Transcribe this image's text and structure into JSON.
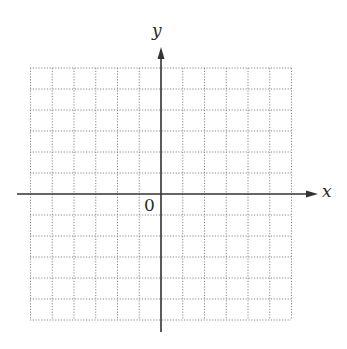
{
  "chart_data": {
    "type": "coordinate-grid",
    "title": "",
    "xlabel": "x",
    "ylabel": "y",
    "origin_label": "0",
    "xlim": [
      -6,
      6
    ],
    "ylim": [
      -6,
      6
    ],
    "grid": true,
    "grid_style": "dotted",
    "grid_step": 1,
    "x_axis_arrow": "right",
    "y_axis_arrow": "up",
    "series": []
  },
  "colors": {
    "axis": "#333333",
    "grid": "#888888",
    "background": "#ffffff"
  }
}
